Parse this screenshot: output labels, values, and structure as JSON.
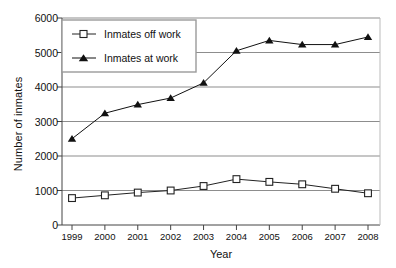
{
  "chart_data": {
    "type": "line",
    "title": "",
    "xlabel": "Year",
    "ylabel": "Number of inmates",
    "categories": [
      "1999",
      "2000",
      "2001",
      "2002",
      "2003",
      "2004",
      "2005",
      "2006",
      "2007",
      "2008"
    ],
    "x": [
      1999,
      2000,
      2001,
      2002,
      2003,
      2004,
      2005,
      2006,
      2007,
      2008
    ],
    "series": [
      {
        "name": "Inmates off work",
        "marker": "open-square",
        "color": "#222222",
        "values": [
          780,
          860,
          940,
          1000,
          1130,
          1330,
          1250,
          1180,
          1050,
          920
        ]
      },
      {
        "name": "Inmates at work",
        "marker": "filled-triangle",
        "color": "#111111",
        "values": [
          2500,
          3240,
          3490,
          3680,
          4120,
          5050,
          5350,
          5230,
          5230,
          5450
        ]
      }
    ],
    "ylim": [
      0,
      6000
    ],
    "yticks": [
      0,
      1000,
      2000,
      3000,
      4000,
      5000,
      6000
    ],
    "ytick_labels": [
      "0",
      "1000",
      "2000",
      "3000",
      "4000",
      "5000",
      "6000"
    ],
    "grid": true,
    "grid_axis": "y",
    "legend_position": "upper-left-inside",
    "legend_entries": [
      "Inmates off work",
      "Inmates at work"
    ]
  }
}
